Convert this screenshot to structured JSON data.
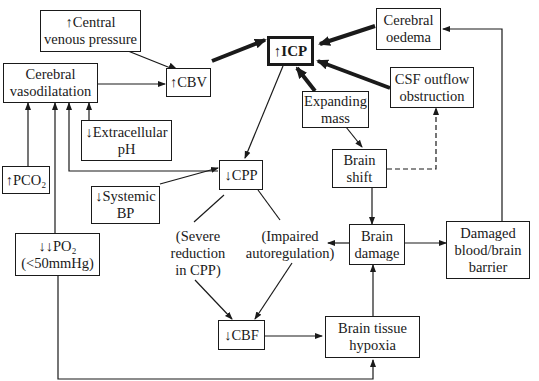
{
  "diagram": {
    "nodes": {
      "icp": {
        "line1": "↑ICP"
      },
      "central_venous_pressure": {
        "line1": "↑Central",
        "line2": "venous pressure"
      },
      "cerebral_vasodilatation": {
        "line1": "Cerebral",
        "line2": "vasodilatation"
      },
      "cbv": {
        "line1": "↑CBV"
      },
      "cerebral_oedema": {
        "line1": "Cerebral",
        "line2": "oedema"
      },
      "csf_outflow_obstruction": {
        "line1": "CSF outflow",
        "line2": "obstruction"
      },
      "expanding_mass": {
        "line1": "Expanding",
        "line2": "mass"
      },
      "extracellular_ph": {
        "line1": "↓Extracellular",
        "line2": "pH"
      },
      "pco2": {
        "line1": "↑PCO₂"
      },
      "cpp": {
        "line1": "↓CPP"
      },
      "systemic_bp": {
        "line1": "↓Systemic",
        "line2": "BP"
      },
      "brain_shift": {
        "line1": "Brain",
        "line2": "shift"
      },
      "po2": {
        "line1": "↓↓PO₂",
        "line2": "(<50mmHg)"
      },
      "brain_damage": {
        "line1": "Brain",
        "line2": "damage"
      },
      "damaged_bbb": {
        "line1": "Damaged",
        "line2": "blood/brain",
        "line3": "barrier"
      },
      "cbf": {
        "line1": "↓CBF"
      },
      "brain_tissue_hypoxia": {
        "line1": "Brain tissue",
        "line2": "hypoxia"
      }
    },
    "labels": {
      "severe_reduction": {
        "line1": "(Severe",
        "line2": "reduction",
        "line3": "in CPP)"
      },
      "impaired_autoregulation": {
        "line1": "(Impaired",
        "line2": "autoregulation)"
      }
    },
    "edges": [
      {
        "from": "cbv",
        "to": "icp",
        "style": "thick"
      },
      {
        "from": "cerebral_oedema",
        "to": "icp",
        "style": "thick"
      },
      {
        "from": "csf_outflow_obstruction",
        "to": "icp",
        "style": "thick"
      },
      {
        "from": "expanding_mass",
        "to": "icp",
        "style": "thick"
      },
      {
        "from": "central_venous_pressure",
        "to": "cbv",
        "style": "thin"
      },
      {
        "from": "cerebral_vasodilatation",
        "to": "cbv",
        "style": "thin"
      },
      {
        "from": "icp",
        "to": "cpp",
        "style": "thin"
      },
      {
        "from": "systemic_bp",
        "to": "cpp",
        "style": "thin"
      },
      {
        "from": "cpp",
        "to": "cerebral_vasodilatation",
        "style": "thin"
      },
      {
        "from": "extracellular_ph",
        "to": "cerebral_vasodilatation",
        "style": "thin"
      },
      {
        "from": "pco2",
        "to": "cerebral_vasodilatation",
        "style": "thin"
      },
      {
        "from": "po2",
        "to": "cerebral_vasodilatation",
        "style": "thin"
      },
      {
        "from": "po2",
        "to": "brain_tissue_hypoxia",
        "style": "thin"
      },
      {
        "from": "expanding_mass",
        "to": "brain_shift",
        "style": "thin"
      },
      {
        "from": "brain_shift",
        "to": "csf_outflow_obstruction",
        "style": "dashed"
      },
      {
        "from": "brain_shift",
        "to": "brain_damage",
        "style": "thin"
      },
      {
        "from": "brain_damage",
        "to": "impaired_autoregulation",
        "style": "thin"
      },
      {
        "from": "brain_damage",
        "to": "damaged_bbb",
        "style": "thin"
      },
      {
        "from": "damaged_bbb",
        "to": "cerebral_oedema",
        "style": "thin"
      },
      {
        "from": "cpp",
        "to": "cbf",
        "style": "thin",
        "via": "severe_reduction"
      },
      {
        "from": "cpp",
        "to": "cbf",
        "style": "thin",
        "via": "impaired_autoregulation"
      },
      {
        "from": "cbf",
        "to": "brain_tissue_hypoxia",
        "style": "thin"
      },
      {
        "from": "brain_tissue_hypoxia",
        "to": "brain_damage",
        "style": "thin"
      }
    ]
  }
}
